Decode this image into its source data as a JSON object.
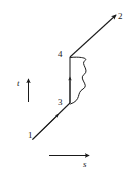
{
  "figure": {
    "type": "feynman-diagram",
    "background_color": "#ffffff",
    "line_color": "#1a1a1a",
    "vertex_labels": [
      {
        "id": "1",
        "text": "1",
        "role": "incoming-endpoint"
      },
      {
        "id": "2",
        "text": "2",
        "role": "outgoing-endpoint"
      },
      {
        "id": "3",
        "text": "3",
        "role": "vertex"
      },
      {
        "id": "4",
        "text": "4",
        "role": "vertex"
      }
    ],
    "axes": {
      "time": {
        "label": "t",
        "direction": "up"
      },
      "space": {
        "label": "s",
        "direction": "right"
      }
    },
    "lines": [
      {
        "name": "segment-1-to-3",
        "style": "straight",
        "arrow": "midpoint-forward"
      },
      {
        "name": "segment-3-to-4",
        "style": "straight",
        "arrow": "midpoint-up"
      },
      {
        "name": "segment-4-to-2",
        "style": "straight",
        "arrow": "endpoint-forward"
      },
      {
        "name": "photon-3-to-4",
        "style": "wavy",
        "arrow": "none"
      }
    ]
  }
}
